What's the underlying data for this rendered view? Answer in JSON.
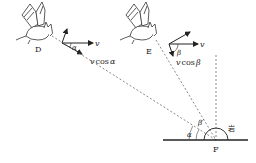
{
  "diagram": {
    "points": {
      "D": "D",
      "E": "E",
      "F": "F"
    },
    "bat_D": {
      "velocity_label": "v",
      "component_label": "v cos α",
      "component_v": "v",
      "component_cos": "cos",
      "angle_label": "α"
    },
    "bat_E": {
      "velocity_label": "v",
      "component_v": "v",
      "component_cos": "cos",
      "angle_label": "β"
    },
    "rock_label": "岩",
    "angles_at_F": {
      "alpha": "α",
      "beta": "β"
    }
  }
}
